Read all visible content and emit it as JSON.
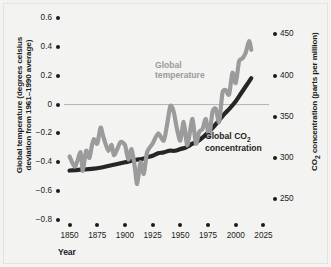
{
  "chart_data": {
    "type": "line",
    "title": "",
    "xlabel": "Year",
    "ylabel": "Global temperature (degrees celsius deviation from 1961–1990 average)",
    "ylabel_right": "CO2 concentration (parts per million)",
    "xlim": [
      1845,
      2030
    ],
    "ylim": [
      -0.8,
      0.6
    ],
    "ylim_right": [
      225,
      470
    ],
    "xticks": [
      1850,
      1875,
      1900,
      1925,
      1950,
      1975,
      2000,
      2025
    ],
    "xticklabels": [
      "1850",
      "1875",
      "1900",
      "1925",
      "1950",
      "1975",
      "2000",
      "2025"
    ],
    "yticks": [
      0.6,
      0.4,
      0.2,
      0,
      -0.2,
      -0.4,
      -0.6,
      -0.8
    ],
    "yticklabels": [
      "0.6",
      "0.4",
      "0.2",
      "0",
      "−0.2",
      "−0.4",
      "−0.6",
      "−0.8"
    ],
    "yticks_right": [
      450,
      400,
      350,
      300,
      250
    ],
    "yticklabels_right": [
      "450",
      "400",
      "350",
      "300",
      "250"
    ],
    "grid": false,
    "zero_line": true,
    "legend_position": "inline-annotations",
    "series": [
      {
        "name": "Global temperature",
        "axis": "left",
        "color": "#9b9b9b",
        "unit": "degrees celsius deviation from 1961-1990 average",
        "x": [
          1850,
          1855,
          1860,
          1862,
          1865,
          1868,
          1870,
          1872,
          1875,
          1878,
          1880,
          1882,
          1885,
          1888,
          1890,
          1893,
          1896,
          1900,
          1903,
          1906,
          1909,
          1911,
          1914,
          1917,
          1920,
          1925,
          1930,
          1935,
          1938,
          1941,
          1944,
          1947,
          1950,
          1953,
          1956,
          1958,
          1961,
          1964,
          1967,
          1970,
          1973,
          1976,
          1979,
          1982,
          1985,
          1988,
          1991,
          1994,
          1997,
          2000,
          2003,
          2006,
          2009,
          2012,
          2014
        ],
        "y": [
          -0.36,
          -0.43,
          -0.33,
          -0.46,
          -0.32,
          -0.37,
          -0.29,
          -0.24,
          -0.27,
          -0.16,
          -0.21,
          -0.26,
          -0.32,
          -0.28,
          -0.35,
          -0.31,
          -0.26,
          -0.28,
          -0.38,
          -0.31,
          -0.44,
          -0.55,
          -0.4,
          -0.48,
          -0.33,
          -0.27,
          -0.2,
          -0.25,
          -0.14,
          -0.01,
          -0.05,
          -0.17,
          -0.25,
          -0.12,
          -0.28,
          -0.22,
          -0.1,
          -0.27,
          -0.19,
          -0.17,
          -0.1,
          -0.22,
          -0.05,
          -0.03,
          -0.12,
          0.08,
          0.1,
          0.07,
          0.22,
          0.15,
          0.3,
          0.32,
          0.36,
          0.44,
          0.38
        ]
      },
      {
        "name": "Global CO2 concentration",
        "axis": "right",
        "color": "#262626",
        "unit": "parts per million",
        "x": [
          1850,
          1860,
          1870,
          1880,
          1890,
          1900,
          1910,
          1915,
          1920,
          1925,
          1930,
          1935,
          1940,
          1945,
          1950,
          1955,
          1958,
          1960,
          1965,
          1970,
          1975,
          1980,
          1985,
          1990,
          1995,
          2000,
          2005,
          2010,
          2014
        ],
        "y": [
          285,
          286,
          287,
          289,
          292,
          295,
          298,
          299,
          301,
          303,
          306,
          307,
          309,
          309,
          311,
          313,
          315,
          317,
          320,
          325,
          331,
          338,
          346,
          354,
          361,
          369,
          379,
          389,
          397
        ]
      }
    ],
    "annotations": [
      {
        "text": "Global temperature",
        "color": "#9b9b9b"
      },
      {
        "text": "Global CO2 concentration",
        "color": "#1f1f1f"
      }
    ]
  },
  "axes": {
    "left_title_line1": "Global temperature (degrees celsius",
    "left_title_line2": "deviation from 1961–1990 average)",
    "right_title_pre": "CO",
    "right_title_sub": "2",
    "right_title_post": " concentration (parts per million)",
    "x_title": "Year"
  },
  "labels": {
    "temperature_line1": "Global",
    "temperature_line2": "temperature",
    "co2_line1_pre": "Global CO",
    "co2_line1_sub": "2",
    "co2_line2": "concentration"
  },
  "colors": {
    "temperature": "#9b9b9b",
    "co2": "#262626",
    "background": "#f3f3f1",
    "text": "#1b1b1b",
    "zero_line": "#b4b4b2"
  }
}
